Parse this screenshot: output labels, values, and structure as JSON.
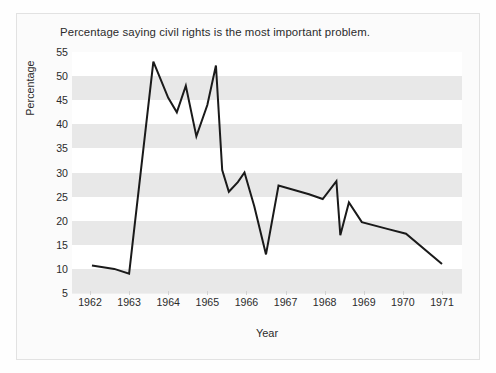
{
  "chart_data": {
    "type": "line",
    "title": "Percentage saying civil rights is the most important problem.",
    "xlabel": "Year",
    "ylabel": "Percentage",
    "ylim": [
      5,
      55
    ],
    "xlim": [
      1962,
      1971
    ],
    "grid": "horizontal-bands",
    "legend": "none",
    "yticks": [
      55,
      50,
      45,
      40,
      35,
      30,
      25,
      20,
      15,
      10,
      5
    ],
    "xticks": [
      1962,
      1963,
      1964,
      1965,
      1966,
      1967,
      1968,
      1969,
      1970,
      1971
    ],
    "series": [
      {
        "name": "Civil rights most important problem",
        "color": "#1a1a1a",
        "x": [
          1962.05,
          1962.62,
          1963.0,
          1963.62,
          1964.0,
          1964.22,
          1964.45,
          1965.0,
          1965.2,
          1965.42,
          1965.62,
          1965.82,
          1966.12,
          1966.38,
          1966.62,
          1967.0,
          1967.52,
          1968.0,
          1968.2,
          1968.35,
          1968.62,
          1969.0,
          1969.52,
          1970.0,
          1970.52,
          1971.0
        ],
        "values": [
          10.7,
          10.0,
          9.0,
          53.0,
          45.5,
          42.5,
          48.0,
          37.5,
          44.0,
          52.2,
          30.5,
          26.0,
          28.0,
          30.0,
          23.0,
          13.0,
          27.3,
          26.0,
          25.0,
          24.5,
          28.2,
          17.0,
          23.8,
          19.7,
          18.5,
          17.3
        ],
        "note_end_value": 11.0
      }
    ],
    "series_points_full": [
      {
        "x": 1962.05,
        "y": 10.7
      },
      {
        "x": 1962.62,
        "y": 10.0
      },
      {
        "x": 1963.0,
        "y": 9.0
      },
      {
        "x": 1963.62,
        "y": 53.0
      },
      {
        "x": 1964.0,
        "y": 45.5
      },
      {
        "x": 1964.22,
        "y": 42.5
      },
      {
        "x": 1964.45,
        "y": 48.0
      },
      {
        "x": 1964.72,
        "y": 37.5
      },
      {
        "x": 1965.0,
        "y": 44.0
      },
      {
        "x": 1965.22,
        "y": 52.2
      },
      {
        "x": 1965.38,
        "y": 30.5
      },
      {
        "x": 1965.55,
        "y": 26.0
      },
      {
        "x": 1965.78,
        "y": 28.0
      },
      {
        "x": 1965.95,
        "y": 30.0
      },
      {
        "x": 1966.2,
        "y": 23.0
      },
      {
        "x": 1966.5,
        "y": 13.0
      },
      {
        "x": 1966.82,
        "y": 27.3
      },
      {
        "x": 1967.6,
        "y": 25.5
      },
      {
        "x": 1967.95,
        "y": 24.5
      },
      {
        "x": 1968.3,
        "y": 28.2
      },
      {
        "x": 1968.4,
        "y": 17.0
      },
      {
        "x": 1968.62,
        "y": 23.8
      },
      {
        "x": 1968.95,
        "y": 19.7
      },
      {
        "x": 1969.6,
        "y": 18.3
      },
      {
        "x": 1970.08,
        "y": 17.3
      },
      {
        "x": 1971.0,
        "y": 11.0
      }
    ]
  },
  "axes": {
    "y_ticks": [
      "55",
      "50",
      "45",
      "40",
      "35",
      "30",
      "25",
      "20",
      "15",
      "10",
      "5"
    ],
    "x_ticks": [
      "1962",
      "1963",
      "1964",
      "1965",
      "1966",
      "1967",
      "1968",
      "1969",
      "1970",
      "1971"
    ],
    "y_axis_label": "Percentage",
    "x_axis_label": "Year"
  },
  "title": {
    "text": "Percentage saying civil rights is the most important problem."
  },
  "colors": {
    "line": "#1a1a1a",
    "band": "#e8e8e8",
    "plot_background": "#ffffff",
    "figure_background": "#fbfbfb",
    "text": "#2b2b2b",
    "border": "#e2e2e2"
  }
}
